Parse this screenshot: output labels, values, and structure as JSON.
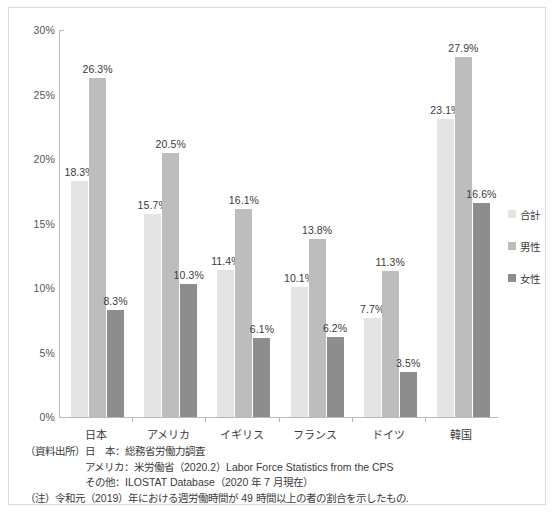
{
  "chart_data": {
    "type": "bar",
    "title": "",
    "subtitle": "",
    "xlabel": "",
    "ylabel": "",
    "categories": [
      "日本",
      "アメリカ",
      "イギリス",
      "フランス",
      "ドイツ",
      "韓国"
    ],
    "series": [
      {
        "name": "合計",
        "color": "#e3e3e3",
        "values": [
          18.3,
          15.7,
          11.4,
          10.1,
          7.7,
          23.1
        ]
      },
      {
        "name": "男性",
        "color": "#bdbdbd",
        "values": [
          26.3,
          20.5,
          16.1,
          13.8,
          11.3,
          27.9
        ]
      },
      {
        "name": "女性",
        "color": "#8d8d8d",
        "values": [
          8.3,
          10.3,
          6.1,
          6.2,
          3.5,
          16.6
        ]
      }
    ],
    "value_labels": [
      [
        "18.3%",
        "15.7%",
        "11.4%",
        "10.1%",
        "7.7%",
        "23.1%"
      ],
      [
        "26.3%",
        "20.5%",
        "16.1%",
        "13.8%",
        "11.3%",
        "27.9%"
      ],
      [
        "8.3%",
        "10.3%",
        "6.1%",
        "6.2%",
        "3.5%",
        "16.6%"
      ]
    ],
    "ylim": [
      0,
      30
    ],
    "ytick_values": [
      0,
      5,
      10,
      15,
      20,
      25,
      30
    ],
    "ytick_labels": [
      "0%",
      "5%",
      "10%",
      "15%",
      "20%",
      "25%",
      "30%"
    ],
    "grid": false,
    "legend_position": "right"
  },
  "legend": {
    "items": [
      {
        "label": "合計",
        "color": "#e3e3e3"
      },
      {
        "label": "男性",
        "color": "#bdbdbd"
      },
      {
        "label": "女性",
        "color": "#8d8d8d"
      }
    ]
  },
  "notes": {
    "source_label": "（資料出所）",
    "lines": [
      {
        "indent": "",
        "text": "日　本：総務省労働力調査"
      },
      {
        "indent": "　　　　　　",
        "text": "アメリカ：米労働省（2020.2）Labor Force Statistics from the CPS"
      },
      {
        "indent": "　　　　　　",
        "text": "その他：ILOSTAT Database（2020 年 7 月現在）"
      }
    ],
    "note_label": "（注）",
    "note_text": "令和元（2019）年における週労働時間が 49 時間以上の者の割合を示したもの."
  }
}
